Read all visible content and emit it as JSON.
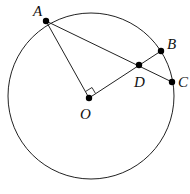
{
  "diagram": {
    "type": "circle-geometry",
    "circle": {
      "center": [
        91,
        96
      ],
      "r": 83
    },
    "points": {
      "A": {
        "label": "A",
        "x": 46,
        "y": 21,
        "label_x": 33,
        "label_y": 16
      },
      "B": {
        "label": "B",
        "x": 161,
        "y": 51,
        "label_x": 167,
        "label_y": 49
      },
      "C": {
        "label": "C",
        "x": 172,
        "y": 82,
        "label_x": 178,
        "label_y": 87
      },
      "D": {
        "label": "D",
        "x": 139,
        "y": 65,
        "label_x": 134,
        "label_y": 87
      },
      "O": {
        "label": "O",
        "x": 89,
        "y": 98,
        "label_x": 80,
        "label_y": 119
      }
    },
    "segments": [
      [
        "A",
        "O"
      ],
      [
        "O",
        "B"
      ],
      [
        "A",
        "C"
      ]
    ],
    "right_angle_at": "O",
    "colors": {
      "stroke": "#222222",
      "point": "#000000"
    }
  }
}
